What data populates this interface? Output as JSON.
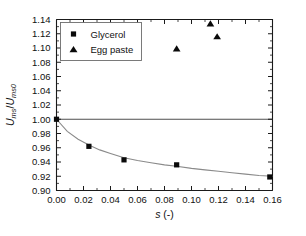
{
  "chart_data": {
    "type": "scatter",
    "title": "",
    "xlabel": "s (-)",
    "ylabel": "Ums/Ums0",
    "xlabel_parts": {
      "symbol": "s",
      "unit": "(-)"
    },
    "ylabel_parts": {
      "num_main": "U",
      "num_sub": "ms",
      "slash": "/",
      "den_main": "U",
      "den_sub": "ms0"
    },
    "xlim": [
      0.0,
      0.16
    ],
    "ylim": [
      0.9,
      1.14
    ],
    "xticks": [
      0.0,
      0.02,
      0.04,
      0.06,
      0.08,
      0.1,
      0.12,
      0.14,
      0.16
    ],
    "xticklabels": [
      "0.00",
      "0.02",
      "0.04",
      "0.06",
      "0.08",
      "0.10",
      "0.12",
      "0.14",
      "0.16"
    ],
    "yticks": [
      0.9,
      0.92,
      0.94,
      0.96,
      0.98,
      1.0,
      1.02,
      1.04,
      1.06,
      1.08,
      1.1,
      1.12,
      1.14
    ],
    "yticklabels": [
      "0.90",
      "0.92",
      "0.94",
      "0.96",
      "0.98",
      "1.00",
      "1.02",
      "1.04",
      "1.06",
      "1.08",
      "1.10",
      "1.12",
      "1.14"
    ],
    "grid": false,
    "minor_ticks": true,
    "reference_line": {
      "y": 1.0,
      "color": "#3a3a3a"
    },
    "legend": {
      "position": "upper-left",
      "entries": [
        {
          "label": "Glycerol",
          "marker": "square",
          "color": "#0a0a0a"
        },
        {
          "label": "Egg paste",
          "marker": "triangle",
          "color": "#0a0a0a"
        }
      ]
    },
    "series": [
      {
        "name": "Glycerol",
        "marker": "square",
        "color": "#0a0a0a",
        "x": [
          0.0,
          0.024,
          0.05,
          0.089,
          0.158
        ],
        "y": [
          1.0,
          0.962,
          0.943,
          0.936,
          0.919
        ],
        "fit_curve": {
          "color": "#8a8a8a",
          "x": [
            0.0,
            0.008,
            0.016,
            0.024,
            0.032,
            0.04,
            0.05,
            0.06,
            0.07,
            0.08,
            0.089,
            0.1,
            0.11,
            0.12,
            0.13,
            0.14,
            0.15,
            0.16
          ],
          "y": [
            1.0,
            0.983,
            0.972,
            0.964,
            0.957,
            0.952,
            0.946,
            0.942,
            0.939,
            0.936,
            0.934,
            0.931,
            0.929,
            0.927,
            0.925,
            0.923,
            0.921,
            0.92
          ]
        }
      },
      {
        "name": "Egg paste",
        "marker": "triangle",
        "color": "#0a0a0a",
        "x": [
          0.089,
          0.114,
          0.119
        ],
        "y": [
          1.099,
          1.134,
          1.116
        ]
      }
    ]
  }
}
